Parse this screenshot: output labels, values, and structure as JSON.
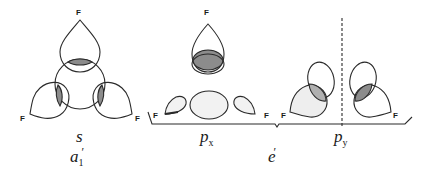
{
  "diagram": {
    "title": "",
    "atom_label": "F",
    "colors": {
      "line": "#2a2a2a",
      "shade": "#8c8c8c",
      "light_shade": "#e6e6e6",
      "background": "#ffffff"
    },
    "groups": [
      {
        "id": "a1",
        "orbital": "s",
        "symmetry": "a",
        "symmetry_sub": "1",
        "symmetry_prime": "′"
      },
      {
        "id": "e",
        "orbitals": [
          {
            "orbital": "p",
            "sub": "x"
          },
          {
            "orbital": "p",
            "sub": "y"
          }
        ],
        "symmetry": "e",
        "symmetry_prime": "′"
      }
    ]
  }
}
